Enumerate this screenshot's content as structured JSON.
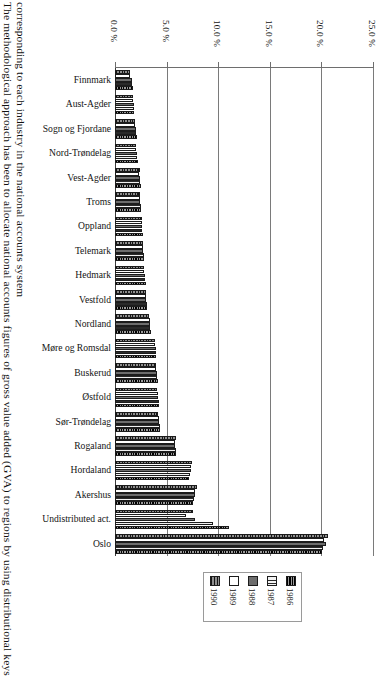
{
  "caption": {
    "line1": "The methodological approach has been to allocate national accounts figures of gross value added (GVA) to regions by using distributional keys",
    "line2": "corresponding to each industry in the national accounts system"
  },
  "chart_data": {
    "type": "bar",
    "orientation": "horizontal",
    "title": "",
    "xlabel": "",
    "ylabel": "",
    "xlim": [
      0.0,
      25.0
    ],
    "xticks": [
      "0.0 %",
      "5.0 %",
      "10.0 %",
      "15.0 %",
      "20.0 %",
      "25.0 %"
    ],
    "xtick_values": [
      0.0,
      5.0,
      10.0,
      15.0,
      20.0,
      25.0
    ],
    "grid": true,
    "legend_position": "bottom",
    "categories": [
      "Finnmark",
      "Aust-Agder",
      "Sogn og Fjordane",
      "Nord-Trøndelag",
      "Vest-Agder",
      "Troms",
      "Oppland",
      "Telemark",
      "Hedmark",
      "Vestfold",
      "Nordland",
      "Møre og Romsdal",
      "Buskerud",
      "Østfold",
      "Sør-Trøndelag",
      "Rogaland",
      "Hordaland",
      "Akershus",
      "Undistributed act.",
      "Oslo"
    ],
    "series": [
      {
        "name": "1990",
        "pattern": "crosshatch",
        "values": [
          1.5,
          1.7,
          1.9,
          2.0,
          2.4,
          2.4,
          2.6,
          2.7,
          2.8,
          3.0,
          3.3,
          3.9,
          4.0,
          4.1,
          4.2,
          5.9,
          7.5,
          7.9,
          7.6,
          20.6
        ]
      },
      {
        "name": "1989",
        "pattern": "open",
        "values": [
          1.5,
          1.7,
          1.9,
          2.0,
          2.3,
          2.4,
          2.6,
          2.7,
          2.8,
          3.0,
          3.4,
          3.9,
          4.0,
          4.2,
          4.3,
          5.8,
          7.4,
          7.8,
          6.9,
          20.3
        ]
      },
      {
        "name": "1988",
        "pattern": "grey",
        "values": [
          1.6,
          1.8,
          2.0,
          2.1,
          2.4,
          2.4,
          2.6,
          2.7,
          2.9,
          3.0,
          3.4,
          4.0,
          4.1,
          4.2,
          4.3,
          5.8,
          7.4,
          7.8,
          7.8,
          20.4
        ]
      },
      {
        "name": "1987",
        "pattern": "hatch",
        "values": [
          1.6,
          1.8,
          2.0,
          2.1,
          2.4,
          2.5,
          2.6,
          2.8,
          2.9,
          3.1,
          3.4,
          4.0,
          4.1,
          4.3,
          4.4,
          5.9,
          7.3,
          7.7,
          9.5,
          20.2
        ]
      },
      {
        "name": "1986",
        "pattern": "dark",
        "values": [
          1.7,
          1.8,
          2.1,
          2.2,
          2.5,
          2.5,
          2.7,
          2.8,
          3.0,
          3.1,
          3.5,
          4.0,
          4.2,
          4.3,
          4.4,
          5.9,
          7.2,
          7.6,
          11.0,
          20.1
        ]
      }
    ],
    "legend_entries": [
      "1990",
      "1989",
      "1988",
      "1987",
      "1986"
    ]
  }
}
